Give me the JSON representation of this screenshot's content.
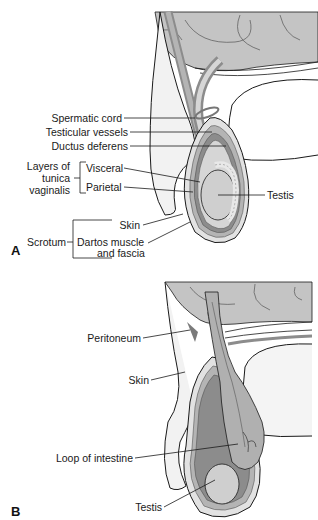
{
  "figure": {
    "colors": {
      "background": "#ffffff",
      "outline": "#1a1a1a",
      "skin_fill": "#ececec",
      "layer_dark": "#8c8c8c",
      "layer_mid": "#b4b4b4",
      "layer_light": "#d6d6d6",
      "intestine": "#b0b0b0",
      "testis": "#cfcfcf",
      "peritoneal_space": "#7a7a7a"
    }
  },
  "panel_a": {
    "letter": "A",
    "labels": {
      "spermatic_cord": "Spermatic cord",
      "testicular_vessels": "Testicular vessels",
      "ductus_deferens": "Ductus deferens",
      "layers_group": "Layers of tunica vaginalis",
      "layers_line1": "Layers of",
      "layers_line2": "tunica",
      "layers_line3": "vaginalis",
      "visceral": "Visceral",
      "parietal": "Parietal",
      "testis": "Testis",
      "scrotum": "Scrotum",
      "skin": "Skin",
      "dartos_line1": "Dartos muscle",
      "dartos_line2": "and fascia"
    }
  },
  "panel_b": {
    "letter": "B",
    "labels": {
      "peritoneum": "Peritoneum",
      "skin": "Skin",
      "loop_of_intestine": "Loop of intestine",
      "testis": "Testis"
    }
  }
}
